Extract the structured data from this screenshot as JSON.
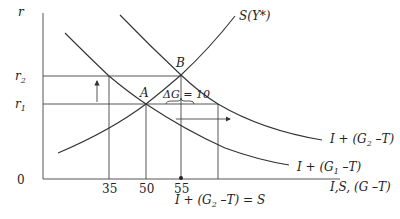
{
  "diagram": {
    "type": "economics-investment-saving",
    "axes": {
      "y_label": "r",
      "x_label": "I,S, (G –T)",
      "origin_label": "0",
      "x_ticks": [
        "35",
        "50",
        "55"
      ],
      "y_ticks": [
        {
          "label": "r",
          "sub": "2"
        },
        {
          "label": "r",
          "sub": "1"
        }
      ]
    },
    "curves": {
      "saving": {
        "label": "S(Y*)"
      },
      "demand_g1": {
        "label_prefix": "I + (G",
        "label_sub": "1",
        "label_suffix": " –T)"
      },
      "demand_g2": {
        "label_prefix": "I + (G",
        "label_sub": "2",
        "label_suffix": " –T)"
      }
    },
    "points": {
      "a": "A",
      "b": "B"
    },
    "annotation": {
      "delta_g": "ΔG = 10"
    },
    "caption": {
      "prefix": "I + (G",
      "sub": "2",
      "suffix": " –T) = S"
    }
  }
}
